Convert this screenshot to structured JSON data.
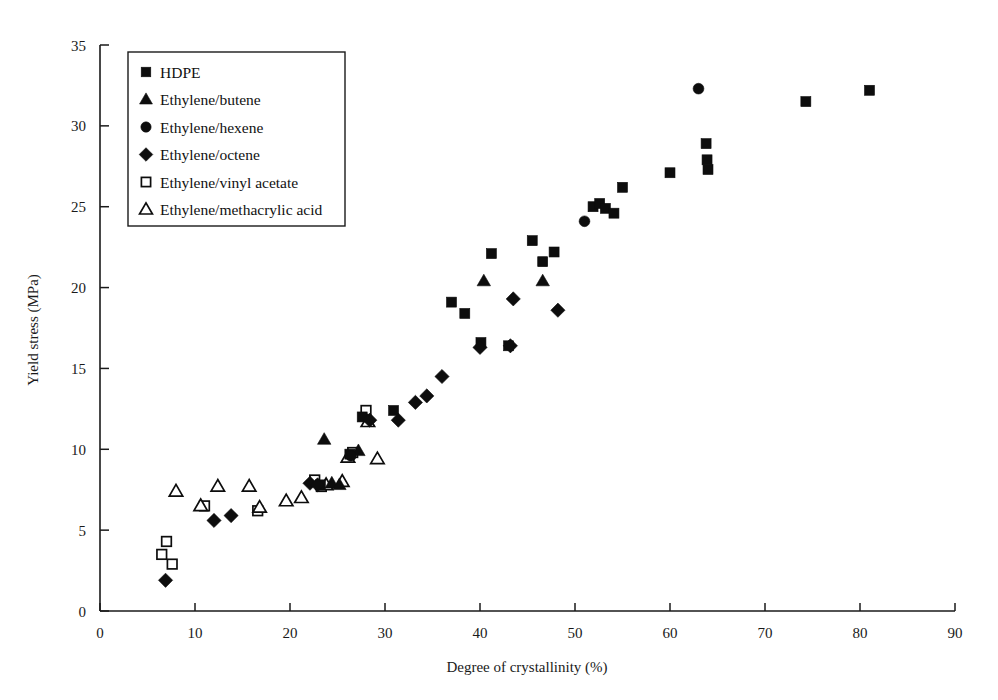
{
  "chart_data": {
    "type": "scatter",
    "title": "",
    "xlabel": "Degree of crystallinity (%)",
    "ylabel": "Yield stress (MPa)",
    "xlim": [
      0,
      90
    ],
    "ylim": [
      0,
      35
    ],
    "xticks": [
      0,
      10,
      20,
      30,
      40,
      50,
      60,
      70,
      80,
      90
    ],
    "yticks": [
      0,
      5,
      10,
      15,
      20,
      25,
      30,
      35
    ],
    "grid": false,
    "legend_position": "top-left",
    "series": [
      {
        "name": "HDPE",
        "marker": "filled-square",
        "color": "#0d0d0d",
        "points": [
          [
            23.2,
            7.8
          ],
          [
            26.3,
            9.7
          ],
          [
            27.6,
            12.0
          ],
          [
            30.9,
            12.4
          ],
          [
            37.0,
            19.1
          ],
          [
            38.4,
            18.4
          ],
          [
            40.1,
            16.6
          ],
          [
            41.2,
            22.1
          ],
          [
            43.0,
            16.4
          ],
          [
            45.5,
            22.9
          ],
          [
            46.6,
            21.6
          ],
          [
            47.8,
            22.2
          ],
          [
            51.9,
            25.0
          ],
          [
            52.6,
            25.2
          ],
          [
            53.2,
            24.9
          ],
          [
            54.1,
            24.6
          ],
          [
            55.0,
            26.2
          ],
          [
            60.0,
            27.1
          ],
          [
            63.8,
            28.9
          ],
          [
            63.9,
            27.9
          ],
          [
            64.0,
            27.3
          ],
          [
            74.3,
            31.5
          ],
          [
            81.0,
            32.2
          ]
        ]
      },
      {
        "name": "Ethylene/butene",
        "marker": "filled-triangle",
        "color": "#0d0d0d",
        "points": [
          [
            23.6,
            10.6
          ],
          [
            24.4,
            7.9
          ],
          [
            25.2,
            7.8
          ],
          [
            27.2,
            9.9
          ],
          [
            40.4,
            20.4
          ],
          [
            46.6,
            20.4
          ]
        ]
      },
      {
        "name": "Ethylene/hexene",
        "marker": "filled-circle",
        "color": "#0d0d0d",
        "points": [
          [
            26.4,
            9.6
          ],
          [
            51.0,
            24.1
          ],
          [
            63.0,
            32.3
          ]
        ]
      },
      {
        "name": "Ethylene/octene",
        "marker": "filled-diamond",
        "color": "#0d0d0d",
        "points": [
          [
            6.9,
            1.9
          ],
          [
            12.0,
            5.6
          ],
          [
            13.8,
            5.9
          ],
          [
            22.1,
            7.9
          ],
          [
            22.9,
            7.8
          ],
          [
            28.4,
            11.8
          ],
          [
            31.4,
            11.8
          ],
          [
            33.2,
            12.9
          ],
          [
            34.4,
            13.3
          ],
          [
            36.0,
            14.5
          ],
          [
            40.0,
            16.3
          ],
          [
            43.2,
            16.4
          ],
          [
            43.5,
            19.3
          ],
          [
            48.2,
            18.6
          ]
        ]
      },
      {
        "name": "Ethylene/vinyl acetate",
        "marker": "open-square",
        "color": "#0d0d0d",
        "points": [
          [
            6.5,
            3.5
          ],
          [
            7.0,
            4.3
          ],
          [
            7.6,
            2.9
          ],
          [
            11.0,
            6.5
          ],
          [
            16.6,
            6.2
          ],
          [
            22.6,
            8.1
          ],
          [
            23.3,
            7.7
          ],
          [
            26.6,
            9.8
          ],
          [
            28.0,
            12.4
          ]
        ]
      },
      {
        "name": "Ethylene/methacrylic acid",
        "marker": "open-triangle",
        "color": "#0d0d0d",
        "points": [
          [
            8.0,
            7.4
          ],
          [
            10.6,
            6.5
          ],
          [
            12.4,
            7.7
          ],
          [
            15.7,
            7.7
          ],
          [
            16.8,
            6.4
          ],
          [
            19.6,
            6.8
          ],
          [
            21.2,
            7.0
          ],
          [
            23.8,
            7.8
          ],
          [
            25.5,
            8.0
          ],
          [
            26.1,
            9.5
          ],
          [
            28.2,
            11.7
          ],
          [
            29.2,
            9.4
          ]
        ]
      }
    ]
  },
  "legend": {
    "items": [
      {
        "label": "HDPE",
        "marker": "filled-square"
      },
      {
        "label": "Ethylene/butene",
        "marker": "filled-triangle"
      },
      {
        "label": "Ethylene/hexene",
        "marker": "filled-circle"
      },
      {
        "label": "Ethylene/octene",
        "marker": "filled-diamond"
      },
      {
        "label": "Ethylene/vinyl acetate",
        "marker": "open-square"
      },
      {
        "label": "Ethylene/methacrylic acid",
        "marker": "open-triangle"
      }
    ]
  },
  "axes": {
    "x_title": "Degree of crystallinity (%)",
    "y_title": "Yield stress (MPa)",
    "x_tick_labels": [
      "0",
      "10",
      "20",
      "30",
      "40",
      "50",
      "60",
      "70",
      "80",
      "90"
    ],
    "y_tick_labels": [
      "0",
      "5",
      "10",
      "15",
      "20",
      "25",
      "30",
      "35"
    ]
  }
}
